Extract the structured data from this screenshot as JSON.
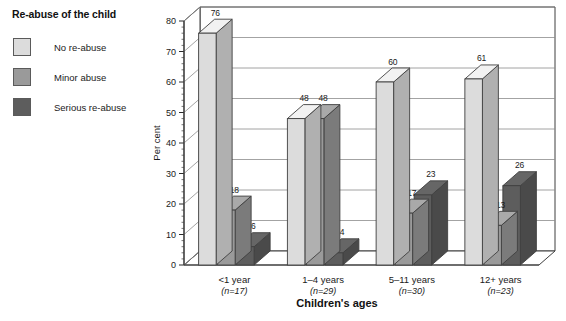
{
  "legend": {
    "title": "Re-abuse of the child",
    "items": [
      {
        "label": "No re-abuse",
        "color": "#dcdcdc"
      },
      {
        "label": "Minor abuse",
        "color": "#9a9a9a"
      },
      {
        "label": "Serious re-abuse",
        "color": "#5d5d5d"
      }
    ]
  },
  "axes": {
    "ylabel": "Per cent",
    "xlabel": "Children's ages"
  },
  "chart_data": {
    "type": "bar",
    "title": "Re-abuse of the child",
    "xlabel": "Children's ages",
    "ylabel": "Per cent",
    "ylim": [
      0,
      80
    ],
    "yticks": [
      0,
      10,
      20,
      30,
      40,
      50,
      60,
      70,
      80
    ],
    "grid": true,
    "legend_position": "left-outside",
    "three_d": true,
    "categories": [
      "<1 year",
      "1–4 years",
      "5–11 years",
      "12+ years"
    ],
    "category_sublabels": [
      "(n=17)",
      "(n=29)",
      "(n=30)",
      "(n=23)"
    ],
    "series": [
      {
        "name": "No re-abuse",
        "color": "#dcdcdc",
        "values": [
          76,
          48,
          60,
          61
        ]
      },
      {
        "name": "Minor abuse",
        "color": "#9a9a9a",
        "values": [
          18,
          48,
          17,
          13
        ]
      },
      {
        "name": "Serious re-abuse",
        "color": "#5d5d5d",
        "values": [
          6,
          4,
          23,
          26
        ]
      }
    ]
  }
}
